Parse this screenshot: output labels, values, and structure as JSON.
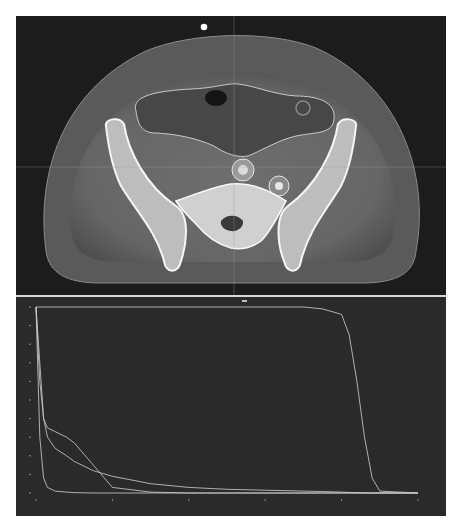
{
  "ct_view": {
    "view": "axial",
    "region": "pelvis",
    "marker": "orientation-dot",
    "crosshair": {
      "x_px": 218,
      "y_px": 151
    },
    "contours": [
      "bowel-bag-contour",
      "left-vessel-contour",
      "right-vessel-contour"
    ],
    "colors": {
      "background": "#1c1c1c",
      "soft_tissue": "#7a7a7a",
      "bone": "#f0f0f0",
      "contour": "#e6e6e6",
      "crosshair": "#9a9a9a"
    }
  },
  "dvh_panel": {
    "colors": {
      "background": "#2a2a2a",
      "curve": "#d0d0d0",
      "axis": "#8a8a8a"
    }
  },
  "chart_data": {
    "type": "line",
    "title": "",
    "xlabel": "",
    "ylabel": "",
    "xlim": [
      0,
      100
    ],
    "ylim": [
      0,
      100
    ],
    "grid": false,
    "legend": null,
    "x": [
      0,
      1,
      2,
      3,
      5,
      8,
      10,
      15,
      20,
      30,
      40,
      50,
      60,
      70,
      75,
      80,
      82,
      84,
      86,
      88,
      90,
      100
    ],
    "series": [
      {
        "name": "target",
        "values": [
          100,
          100,
          100,
          100,
          100,
          100,
          100,
          100,
          100,
          100,
          100,
          100,
          100,
          100,
          99,
          96,
          85,
          60,
          30,
          8,
          1,
          0
        ]
      },
      {
        "name": "organ-a",
        "values": [
          100,
          70,
          40,
          30,
          24,
          20,
          17,
          12,
          9,
          5,
          3,
          2,
          1.5,
          1,
          0.8,
          0.5,
          0.3,
          0.2,
          0.1,
          0,
          0,
          0
        ]
      },
      {
        "name": "organ-b",
        "values": [
          100,
          60,
          40,
          35,
          33,
          30,
          27,
          15,
          3,
          0.5,
          0,
          0,
          0,
          0,
          0,
          0,
          0,
          0,
          0,
          0,
          0,
          0
        ]
      },
      {
        "name": "organ-c",
        "values": [
          100,
          30,
          8,
          3,
          1,
          0.5,
          0.2,
          0,
          0,
          0,
          0,
          0,
          0,
          0,
          0,
          0,
          0,
          0,
          0,
          0,
          0,
          0
        ]
      }
    ]
  }
}
